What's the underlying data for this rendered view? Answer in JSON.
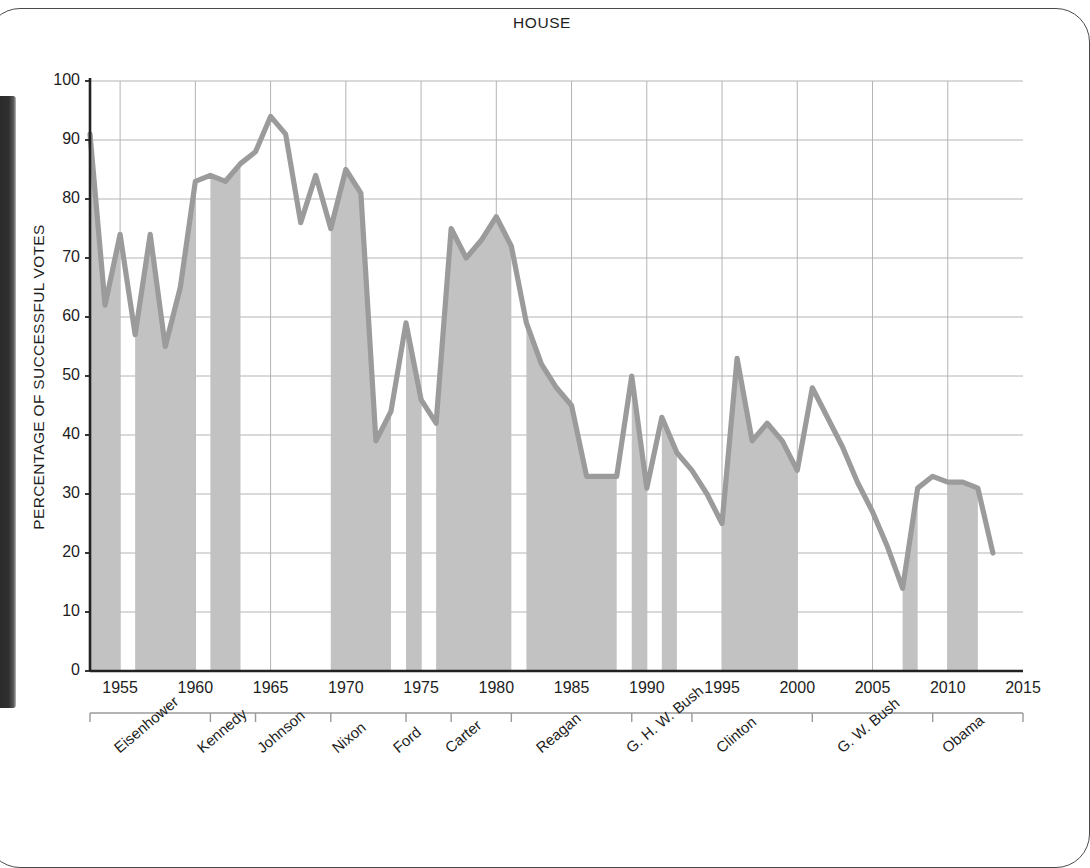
{
  "figure": {
    "title": "HOUSE",
    "y_axis_title": "PERCENTAGE OF SUCCESSFUL VOTES"
  },
  "chart_data": {
    "type": "line",
    "title": "HOUSE",
    "xlabel": "",
    "ylabel": "PERCENTAGE OF SUCCESSFUL VOTES",
    "xlim": [
      1953,
      2015
    ],
    "ylim": [
      0,
      100
    ],
    "ytick_labels": [
      "0",
      "10",
      "20",
      "30",
      "40",
      "50",
      "60",
      "70",
      "80",
      "90",
      "100"
    ],
    "ytick_values": [
      0,
      10,
      20,
      30,
      40,
      50,
      60,
      70,
      80,
      90,
      100
    ],
    "xtick_labels": [
      "1955",
      "1960",
      "1965",
      "1970",
      "1975",
      "1980",
      "1985",
      "1990",
      "1995",
      "2000",
      "2005",
      "2010",
      "2015"
    ],
    "xtick_values": [
      1955,
      1960,
      1965,
      1970,
      1975,
      1980,
      1985,
      1990,
      1995,
      2000,
      2005,
      2010,
      2015
    ],
    "grid": true,
    "legend": "none",
    "line_color": "#9b9b9b",
    "band_color": "#c2c2c2",
    "series": [
      {
        "name": "Percentage of successful votes (House)",
        "x": [
          1953,
          1954,
          1955,
          1956,
          1957,
          1958,
          1959,
          1960,
          1961,
          1962,
          1963,
          1964,
          1965,
          1966,
          1967,
          1968,
          1969,
          1970,
          1971,
          1972,
          1973,
          1974,
          1975,
          1976,
          1977,
          1978,
          1979,
          1980,
          1981,
          1982,
          1983,
          1984,
          1985,
          1986,
          1987,
          1988,
          1989,
          1990,
          1991,
          1992,
          1993,
          1994,
          1995,
          1996,
          1997,
          1998,
          1999,
          2000,
          2001,
          2002,
          2003,
          2004,
          2005,
          2006,
          2007,
          2008,
          2009,
          2010,
          2011,
          2012,
          2013
        ],
        "y": [
          91,
          62,
          74,
          57,
          74,
          55,
          65,
          83,
          84,
          83,
          86,
          88,
          94,
          91,
          76,
          84,
          75,
          85,
          81,
          39,
          44,
          59,
          46,
          42,
          75,
          70,
          73,
          77,
          72,
          59,
          52,
          48,
          45,
          33,
          33,
          33,
          50,
          31,
          43,
          37,
          34,
          30,
          25,
          53,
          39,
          42,
          39,
          34,
          48,
          43,
          38,
          32,
          27,
          21,
          14,
          31,
          33,
          32,
          32,
          31,
          20
        ]
      }
    ],
    "shaded_bands": [
      {
        "from": 1953,
        "to": 1955
      },
      {
        "from": 1956,
        "to": 1960
      },
      {
        "from": 1961,
        "to": 1963
      },
      {
        "from": 1969,
        "to": 1973
      },
      {
        "from": 1974,
        "to": 1975
      },
      {
        "from": 1976,
        "to": 1981
      },
      {
        "from": 1982,
        "to": 1988
      },
      {
        "from": 1989,
        "to": 1990
      },
      {
        "from": 1991,
        "to": 1992
      },
      {
        "from": 1995,
        "to": 2000
      },
      {
        "from": 2007,
        "to": 2008
      },
      {
        "from": 2010,
        "to": 2012
      }
    ],
    "annotations": {
      "presidents": [
        {
          "label": "Eisenhower",
          "start": 1953,
          "end": 1961
        },
        {
          "label": "Kennedy",
          "start": 1961,
          "end": 1964
        },
        {
          "label": "Johnson",
          "start": 1964,
          "end": 1969
        },
        {
          "label": "Nixon",
          "start": 1969,
          "end": 1974
        },
        {
          "label": "Ford",
          "start": 1974,
          "end": 1977
        },
        {
          "label": "Carter",
          "start": 1977,
          "end": 1981
        },
        {
          "label": "Reagan",
          "start": 1981,
          "end": 1989
        },
        {
          "label": "G. H. W. Bush",
          "start": 1989,
          "end": 1993
        },
        {
          "label": "Clinton",
          "start": 1993,
          "end": 2001
        },
        {
          "label": "G. W. Bush",
          "start": 2001,
          "end": 2009
        },
        {
          "label": "Obama",
          "start": 2009,
          "end": 2015
        }
      ]
    }
  }
}
